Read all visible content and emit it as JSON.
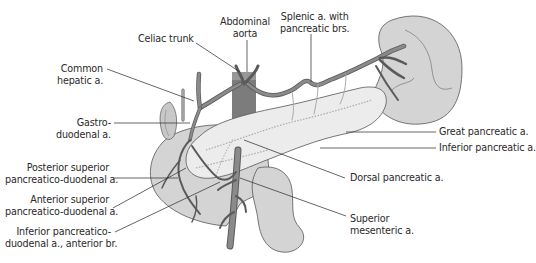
{
  "figure": {
    "colors": {
      "organ_fill": "#d4d4d4",
      "pancreas_fill": "#ececec",
      "artery_fill": "#8a8a8a",
      "artery_stroke": "#4a4a4a",
      "aorta_fill": "#7c7c7c",
      "leader_line": "#333333",
      "text": "#2a2a2a"
    },
    "labels": {
      "celiac_trunk": "Celiac trunk",
      "abdominal_aorta": "Abdominal\naorta",
      "splenic_artery": "Splenic a. with\npancreatic brs.",
      "common_hepatic": "Common\nhepatic a.",
      "gastroduodenal": "Gastro-\nduodenal a.",
      "great_pancreatic": "Great pancreatic a.",
      "inferior_pancreatic": "Inferior pancreatic a.",
      "posterior_superior_pd": "Posterior superior\npancreatico-duodenal a.",
      "anterior_superior_pd": "Anterior superior\npancreatico-duodenal a.",
      "dorsal_pancreatic": "Dorsal pancreatic a.",
      "inferior_pd_anterior": "Inferior pancreatico-\nduodenal a., anterior br.",
      "superior_mesenteric": "Superior\nmesenteric a."
    }
  }
}
